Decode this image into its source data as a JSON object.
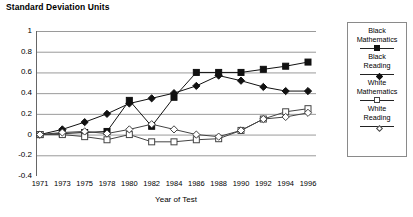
{
  "chart_data": {
    "type": "line",
    "title": "Standard Deviation Units",
    "subtitle": "",
    "xlabel": "Year of Test",
    "ylabel": "",
    "grid": true,
    "legend_position": "right",
    "ylim": [
      -0.4,
      1
    ],
    "ytick_labels": [
      "1",
      "0.8",
      "0.6",
      "0.4",
      "0.2",
      "0",
      "-0.2",
      "-0.4"
    ],
    "ytick_values": [
      1,
      0.8,
      0.6,
      0.4,
      0.2,
      0,
      -0.2,
      -0.4
    ],
    "categories": [
      "1971",
      "1973",
      "1975",
      "1978",
      "1980",
      "1982",
      "1984",
      "1986",
      "1988",
      "1990",
      "1992",
      "1994",
      "1996"
    ],
    "x": [
      1971,
      1973,
      1975,
      1978,
      1980,
      1982,
      1984,
      1986,
      1988,
      1990,
      1992,
      1994,
      1996
    ],
    "series": [
      {
        "name": "Black Mathematics",
        "marker": "filled-square",
        "color": "#111111",
        "values": [
          0.0,
          0.01,
          0.02,
          0.03,
          0.33,
          0.08,
          0.36,
          0.6,
          0.6,
          0.6,
          0.63,
          0.66,
          0.7
        ]
      },
      {
        "name": "Black Reading",
        "marker": "filled-diamond",
        "color": "#111111",
        "values": [
          0.0,
          0.05,
          0.12,
          0.2,
          0.3,
          0.35,
          0.4,
          0.47,
          0.57,
          0.52,
          0.46,
          0.42,
          0.42
        ]
      },
      {
        "name": "White Mathematics",
        "marker": "open-square",
        "color": "#444444",
        "values": [
          0.0,
          0.0,
          -0.02,
          -0.05,
          0.0,
          -0.07,
          -0.07,
          -0.05,
          -0.04,
          0.04,
          0.15,
          0.22,
          0.25
        ]
      },
      {
        "name": "White Reading",
        "marker": "open-diamond",
        "color": "#444444",
        "values": [
          0.0,
          0.02,
          0.03,
          0.01,
          0.05,
          0.1,
          0.05,
          0.0,
          -0.02,
          0.04,
          0.15,
          0.17,
          0.21
        ]
      }
    ],
    "legend_entries": [
      {
        "line1": "Black",
        "line2": "Mathematics",
        "marker": "filled-square"
      },
      {
        "line1": "Black",
        "line2": "Reading",
        "marker": "filled-diamond"
      },
      {
        "line1": "White",
        "line2": "Mathematics",
        "marker": "open-square"
      },
      {
        "line1": "White",
        "line2": "Reading",
        "marker": "open-diamond"
      }
    ]
  }
}
